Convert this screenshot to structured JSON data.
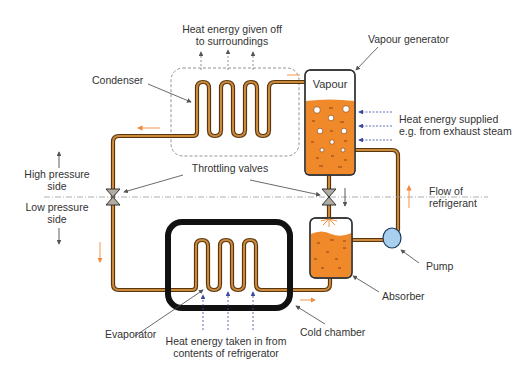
{
  "labels": {
    "heat_given_off_line1": "Heat energy given off",
    "heat_given_off_line2": "to surroundings",
    "vapour_generator": "Vapour generator",
    "vapour": "Vapour",
    "condenser": "Condenser",
    "heat_supplied_line1": "Heat energy supplied",
    "heat_supplied_line2": "e.g. from exhaust steam",
    "high_pressure_line1": "High pressure",
    "high_pressure_line2": "side",
    "throttling_valves": "Throttling valves",
    "low_pressure_line1": "Low pressure",
    "low_pressure_line2": "side",
    "flow_line1": "Flow of",
    "flow_line2": "refrigerant",
    "pump": "Pump",
    "absorber": "Absorber",
    "evaporator": "Evaporator",
    "cold_chamber": "Cold chamber",
    "heat_taken_line1": "Heat energy taken in from",
    "heat_taken_line2": "contents of refrigerator"
  },
  "colors": {
    "pipe_outer": "#5a3510",
    "pipe_inner": "#c98a3c",
    "liquid": "#f0892a",
    "pump": "#a8d0ee",
    "valve": "#b0aca2",
    "flow_arrow": "#f08a3c",
    "heat_arrow_blue": "#3a4aa0",
    "dashed_box": "#888888",
    "cold_chamber": "#111111",
    "text": "#333333"
  }
}
